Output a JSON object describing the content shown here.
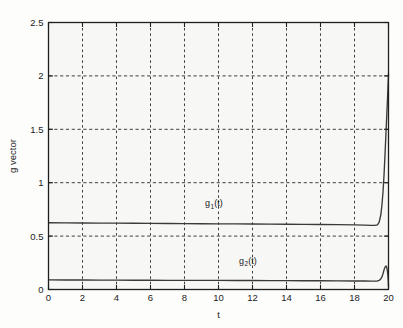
{
  "chart_data": {
    "type": "line",
    "title": "",
    "xlabel": "t",
    "ylabel": "g vector",
    "xlim": [
      0,
      20
    ],
    "ylim": [
      0,
      2.5
    ],
    "grid": true,
    "grid_style": "dashed",
    "legend": "inline-annotations",
    "xticks": [
      0,
      2,
      4,
      6,
      8,
      10,
      12,
      14,
      16,
      18,
      20
    ],
    "xtick_labels": [
      "0",
      "2",
      "4",
      "6",
      "8",
      "10",
      "12",
      "14",
      "16",
      "18",
      "20"
    ],
    "yticks": [
      0,
      0.5,
      1,
      1.5,
      2,
      2.5
    ],
    "ytick_labels": [
      "0",
      "0.5",
      "1",
      "1.5",
      "2",
      "2.5"
    ],
    "annotations": [
      {
        "text": "g",
        "sub": "1",
        "suffix": "(t)",
        "x": 9.2,
        "y": 0.78
      },
      {
        "text": "g",
        "sub": "2",
        "suffix": "(t)",
        "x": 11.2,
        "y": 0.24
      }
    ],
    "series": [
      {
        "name": "g1(t)",
        "color": "#3a3a3a",
        "x": [
          0.0,
          1.0,
          2.0,
          3.0,
          4.0,
          5.0,
          6.0,
          7.0,
          8.0,
          9.0,
          10.0,
          11.0,
          12.0,
          13.0,
          14.0,
          15.0,
          16.0,
          17.0,
          18.0,
          18.6,
          19.0,
          19.2,
          19.35,
          19.45,
          19.55,
          19.62,
          19.68,
          19.74,
          19.8,
          19.85,
          19.9,
          19.94,
          19.97,
          19.99,
          20.0
        ],
        "y": [
          0.625,
          0.624,
          0.623,
          0.622,
          0.621,
          0.62,
          0.619,
          0.618,
          0.617,
          0.616,
          0.615,
          0.614,
          0.613,
          0.612,
          0.611,
          0.61,
          0.609,
          0.607,
          0.605,
          0.603,
          0.6,
          0.6,
          0.605,
          0.63,
          0.7,
          0.8,
          0.92,
          1.08,
          1.28,
          1.46,
          1.64,
          1.78,
          1.9,
          1.97,
          2.02
        ]
      },
      {
        "name": "g2(t)",
        "color": "#3a3a3a",
        "x": [
          0.0,
          1.0,
          2.0,
          3.0,
          4.0,
          5.0,
          6.0,
          7.0,
          8.0,
          9.0,
          10.0,
          11.0,
          12.0,
          13.0,
          14.0,
          15.0,
          16.0,
          17.0,
          18.0,
          18.6,
          19.0,
          19.2,
          19.35,
          19.45,
          19.55,
          19.62,
          19.68,
          19.74,
          19.8,
          19.86,
          19.9,
          19.94,
          19.97,
          19.99,
          20.0
        ],
        "y": [
          0.09,
          0.089,
          0.089,
          0.088,
          0.088,
          0.087,
          0.087,
          0.086,
          0.086,
          0.085,
          0.085,
          0.084,
          0.084,
          0.083,
          0.083,
          0.082,
          0.082,
          0.081,
          0.08,
          0.08,
          0.079,
          0.079,
          0.08,
          0.085,
          0.1,
          0.12,
          0.15,
          0.185,
          0.21,
          0.22,
          0.205,
          0.17,
          0.12,
          0.07,
          0.03
        ]
      }
    ]
  }
}
